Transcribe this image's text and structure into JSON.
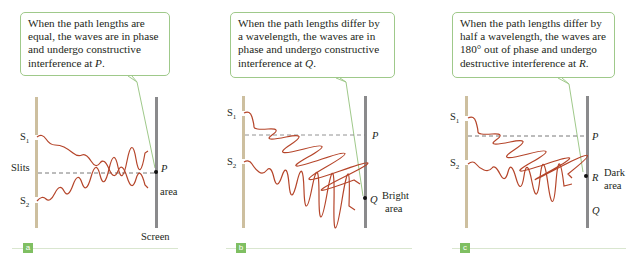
{
  "figure": {
    "panels": [
      {
        "id": "a",
        "badge": "a",
        "callout": "When the path lengths are equal, the waves are in phase and undergo constructive interference at P.",
        "callout_lines": [
          "When the path lengths are",
          "equal, the waves are in phase",
          "and undergo constructive",
          "interference at "
        ],
        "callout_point": "P",
        "labels": {
          "s1": "S",
          "s1_sub": "1",
          "s2": "S",
          "s2_sub": "2",
          "slits": "Slits",
          "point": "P",
          "area": "area",
          "screen": "Screen"
        }
      },
      {
        "id": "b",
        "badge": "b",
        "callout": "When the path lengths differ by a wavelength, the waves are in phase and undergo constructive interference at Q.",
        "callout_lines": [
          "When the path lengths differ by",
          "a wavelength, the waves are in",
          "phase and undergo constructive",
          "interference at "
        ],
        "callout_point": "Q",
        "labels": {
          "s1": "S",
          "s1_sub": "1",
          "s2": "S",
          "s2_sub": "2",
          "p": "P",
          "point": "Q",
          "area_1": "Bright",
          "area_2": "area"
        }
      },
      {
        "id": "c",
        "badge": "c",
        "callout": "When the path lengths differ by half a wavelength, the waves are 180° out of phase and undergo destructive interference at R.",
        "callout_lines": [
          "When the path lengths differ by",
          "half a wavelength, the waves are",
          "180° out of phase and undergo",
          "destructive interference at "
        ],
        "callout_point": "R",
        "labels": {
          "s1": "S",
          "s1_sub": "1",
          "s2": "S",
          "s2_sub": "2",
          "p": "P",
          "point": "R",
          "q": "Q",
          "area_1": "Dark",
          "area_2": "area"
        }
      }
    ],
    "colors": {
      "wave": "#b5452a",
      "slit_barrier": "#cdbf9f",
      "screen": "#8a8a8c",
      "callout_border": "#9fc98a",
      "badge": "#7fbf62",
      "dashed": "#555555"
    }
  }
}
